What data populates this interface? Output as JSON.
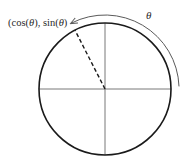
{
  "diagram": {
    "type": "unit-circle",
    "labels": {
      "point": "(cos(θ), sin(θ))",
      "point_parts": [
        "(cos(",
        "θ",
        "), sin(",
        "θ",
        ")"
      ],
      "angle": "θ"
    },
    "geometry": {
      "center": [
        105,
        89
      ],
      "radius": 66,
      "point_angle_deg": 117,
      "arrow_radius": 74,
      "arrow_start_deg": 2,
      "arrow_end_deg": 117
    },
    "colors": {
      "circle": "#1a1a1a",
      "axes": "#6a6a6a",
      "dashed_radius": "#1a1a1a",
      "arrow": "#5a5a5a",
      "text": "#2a2a2a"
    }
  }
}
